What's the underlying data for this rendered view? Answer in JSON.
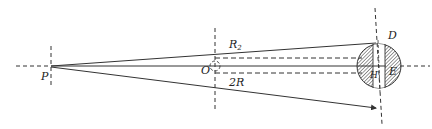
{
  "diagram": {
    "type": "optics-geometry",
    "colors": {
      "stroke": "#333333",
      "hatch": "#555555",
      "background": "#ffffff"
    },
    "points": {
      "P": {
        "label": "P"
      },
      "O": {
        "label": "O"
      },
      "D": {
        "label": "D"
      },
      "E": {
        "label": "E"
      },
      "H": {
        "label": "H"
      }
    },
    "segments": {
      "upper": {
        "label": "R",
        "subscript": "2"
      },
      "lower": {
        "label": "2R"
      }
    }
  }
}
